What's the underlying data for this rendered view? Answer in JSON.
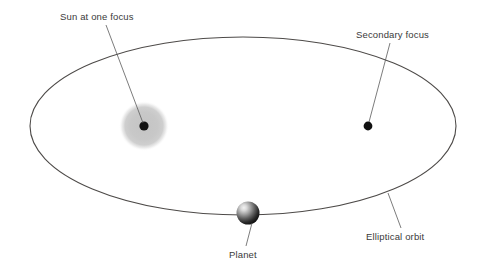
{
  "diagram": {
    "background_color": "#ffffff",
    "orbit": {
      "name": "Elliptical orbit",
      "center_x": 243,
      "center_y": 126,
      "radius_x": 213,
      "radius_y": 89,
      "stroke_color": "#4d4a48",
      "stroke_width": 1.1
    },
    "sun": {
      "label": "Sun at one focus",
      "x": 144,
      "y": 126,
      "core_radius": 4.6,
      "core_color": "#111111",
      "halo_radius": 25,
      "halo_color": "#c9c9c9"
    },
    "secondary_focus": {
      "label": "Secondary focus",
      "x": 368,
      "y": 126,
      "radius": 4.4,
      "color": "#111111"
    },
    "planet": {
      "label": "Planet",
      "x": 248,
      "y": 213,
      "radius": 11.5,
      "highlight_color": "#e8e8e8",
      "shadow_color": "#111111"
    },
    "labels": [
      {
        "name": "sun-label",
        "text": "Sun at one focus",
        "text_x": 60,
        "text_y": 20,
        "anchor": "start",
        "leader_from_x": 106,
        "leader_from_y": 25,
        "leader_to_x": 143,
        "leader_to_y": 123
      },
      {
        "name": "secondary-focus-label",
        "text": "Secondary focus",
        "text_x": 356,
        "text_y": 38,
        "anchor": "start",
        "leader_from_x": 390,
        "leader_from_y": 43,
        "leader_to_x": 369,
        "leader_to_y": 122
      },
      {
        "name": "planet-label",
        "text": "Planet",
        "text_x": 229,
        "text_y": 258,
        "anchor": "start",
        "leader_from_x": 246,
        "leader_from_y": 246,
        "leader_to_x": 252,
        "leader_to_y": 223
      },
      {
        "name": "elliptical-orbit-label",
        "text": "Elliptical orbit",
        "text_x": 366,
        "text_y": 240,
        "anchor": "start",
        "leader_from_x": 401,
        "leader_from_y": 228,
        "leader_to_x": 388,
        "leader_to_y": 193
      }
    ],
    "leader_line_color": "#5a5a5a",
    "leader_line_width": 0.8,
    "text_color": "#3a3a3a"
  }
}
